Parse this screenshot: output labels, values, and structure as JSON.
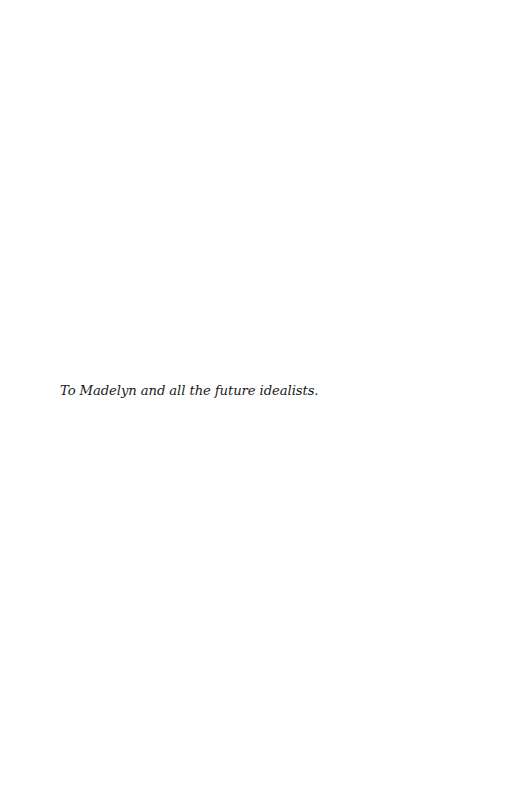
{
  "page": {
    "dedication": "To Madelyn and all the future idealists."
  }
}
